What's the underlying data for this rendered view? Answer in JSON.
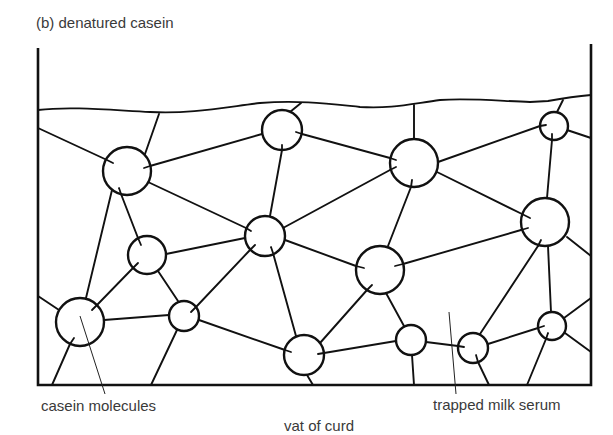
{
  "figure": {
    "title": "(b)  denatured casein",
    "labels": {
      "casein_molecules": "casein molecules",
      "trapped_milk_serum": "trapped milk serum",
      "vat_of_curd": "vat of curd"
    },
    "colors": {
      "ink": "#111111",
      "text": "#3a3a3a",
      "background": "#ffffff"
    },
    "vat": {
      "left_wall_x": 38,
      "right_wall_x": 591,
      "bottom_y": 385,
      "top_y": 44
    },
    "molecules": [
      {
        "id": 1,
        "cx": 127,
        "cy": 171,
        "r": 24
      },
      {
        "id": 2,
        "cx": 282,
        "cy": 130,
        "r": 20
      },
      {
        "id": 3,
        "cx": 414,
        "cy": 163,
        "r": 24
      },
      {
        "id": 4,
        "cx": 554,
        "cy": 126,
        "r": 14
      },
      {
        "id": 5,
        "cx": 545,
        "cy": 222,
        "r": 24
      },
      {
        "id": 6,
        "cx": 147,
        "cy": 255,
        "r": 19
      },
      {
        "id": 7,
        "cx": 265,
        "cy": 236,
        "r": 20
      },
      {
        "id": 8,
        "cx": 184,
        "cy": 316,
        "r": 15
      },
      {
        "id": 9,
        "cx": 380,
        "cy": 270,
        "r": 24
      },
      {
        "id": 10,
        "cx": 80,
        "cy": 322,
        "r": 24
      },
      {
        "id": 11,
        "cx": 304,
        "cy": 355,
        "r": 20
      },
      {
        "id": 12,
        "cx": 411,
        "cy": 340,
        "r": 15
      },
      {
        "id": 13,
        "cx": 473,
        "cy": 348,
        "r": 15
      },
      {
        "id": 14,
        "cx": 552,
        "cy": 326,
        "r": 14
      }
    ]
  }
}
